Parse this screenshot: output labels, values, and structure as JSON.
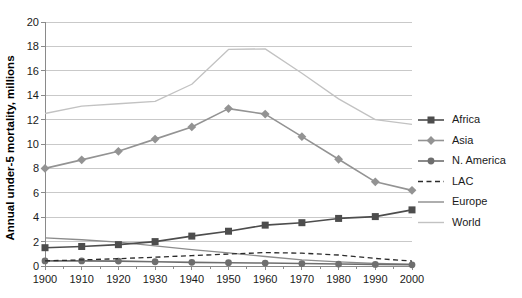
{
  "chart_data": {
    "type": "line",
    "title": "",
    "xlabel": "",
    "ylabel": "Annual under-5 mortality, millions",
    "x": [
      1900,
      1910,
      1920,
      1930,
      1940,
      1950,
      1960,
      1970,
      1980,
      1990,
      2000
    ],
    "xtick_labels": [
      "1900",
      "1910",
      "1920",
      "1930",
      "1940",
      "1950",
      "1960",
      "1970",
      "1980",
      "1990",
      "2000"
    ],
    "ytick_labels": [
      "0",
      "2",
      "4",
      "6",
      "8",
      "10",
      "12",
      "14",
      "16",
      "18",
      "20"
    ],
    "yticks": [
      0,
      2,
      4,
      6,
      8,
      10,
      12,
      14,
      16,
      18,
      20
    ],
    "ylim": [
      0,
      20
    ],
    "xlim": [
      1900,
      2000
    ],
    "grid": "horizontal",
    "legend_position": "right",
    "series": [
      {
        "name": "Africa",
        "color": "#4d4d4d",
        "marker": "square",
        "dash": "solid",
        "values": [
          1.5,
          1.6,
          1.75,
          2.0,
          2.45,
          2.85,
          3.35,
          3.55,
          3.9,
          4.05,
          4.6
        ]
      },
      {
        "name": "Asia",
        "color": "#939393",
        "marker": "diamond",
        "dash": "solid",
        "values": [
          8.0,
          8.7,
          9.4,
          10.4,
          11.4,
          12.9,
          12.45,
          10.6,
          8.75,
          6.9,
          6.2
        ]
      },
      {
        "name": "N. America",
        "color": "#6e6e6e",
        "marker": "circle",
        "dash": "solid",
        "values": [
          0.42,
          0.42,
          0.4,
          0.35,
          0.3,
          0.27,
          0.24,
          0.2,
          0.16,
          0.13,
          0.1
        ]
      },
      {
        "name": "LAC",
        "color": "#2b2b2b",
        "marker": "none",
        "dash": "dashed",
        "values": [
          0.42,
          0.5,
          0.6,
          0.72,
          0.85,
          0.98,
          1.1,
          1.05,
          0.9,
          0.62,
          0.4
        ]
      },
      {
        "name": "Europe",
        "color": "#8c8c8c",
        "marker": "none",
        "dash": "solid",
        "values": [
          2.3,
          2.15,
          1.95,
          1.65,
          1.35,
          1.08,
          0.78,
          0.5,
          0.33,
          0.22,
          0.16
        ]
      },
      {
        "name": "World",
        "color": "#c2c2c2",
        "marker": "none",
        "dash": "solid",
        "values": [
          12.5,
          13.1,
          13.3,
          13.5,
          14.9,
          17.75,
          17.8,
          15.8,
          13.7,
          12.0,
          11.6
        ]
      }
    ]
  },
  "axis": {
    "y_title": "Annual under-5 mortality, millions"
  },
  "legend": {
    "items": [
      {
        "label": "Africa"
      },
      {
        "label": "Asia"
      },
      {
        "label": "N. America"
      },
      {
        "label": "LAC"
      },
      {
        "label": "Europe"
      },
      {
        "label": "World"
      }
    ]
  }
}
